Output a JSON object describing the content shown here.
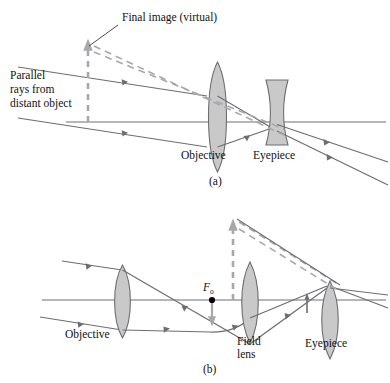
{
  "figure": {
    "colors": {
      "ray": "#6e6e72",
      "axis": "#6e6e72",
      "lens_fill": "#c9c9c9",
      "lens_stroke": "#6e6e72",
      "dashed_virtual": "#a8a8ac",
      "text": "#111111",
      "leader": "#3a3a3a",
      "point": "#000000"
    },
    "panels": [
      {
        "id": "a",
        "caption": "(a)",
        "annotations": [
          {
            "name": "final-image-label",
            "text": "Final image (virtual)"
          },
          {
            "name": "parallel-rays-label",
            "lines": [
              "Parallel",
              "rays from",
              "distant object"
            ]
          }
        ],
        "elements": [
          {
            "name": "objective-lens",
            "label": "Objective",
            "type": "biconvex"
          },
          {
            "name": "eyepiece-lens",
            "label": "Eyepiece",
            "type": "biconcave"
          }
        ]
      },
      {
        "id": "b",
        "caption": "(b)",
        "annotations": [
          {
            "name": "focal-point-label",
            "text": "F",
            "subscript": "o"
          }
        ],
        "elements": [
          {
            "name": "objective-lens",
            "label": "Objective",
            "type": "biconvex"
          },
          {
            "name": "field-lens",
            "label_lines": [
              "Field",
              "lens"
            ],
            "type": "biconvex"
          },
          {
            "name": "eyepiece-lens",
            "label": "Eyepiece",
            "type": "biconvex"
          }
        ]
      }
    ],
    "labels": {
      "final_image": "Final image (virtual)",
      "parallel_1": "Parallel",
      "parallel_2": "rays from",
      "parallel_3": "distant object",
      "objective_a": "Objective",
      "eyepiece_a": "Eyepiece",
      "caption_a": "(a)",
      "focal_f": "F",
      "focal_sub": "o",
      "objective_b": "Objective",
      "field_1": "Field",
      "field_2": "lens",
      "eyepiece_b": "Eyepiece",
      "caption_b": "(b)"
    }
  }
}
